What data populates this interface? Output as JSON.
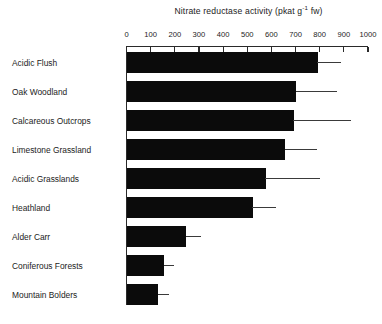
{
  "chart_data": {
    "type": "bar",
    "orientation": "horizontal",
    "title": "Nitrate reductase activity (pkat g-1 fw)",
    "title_main": "Nitrate reductase activity (pkat g",
    "title_sup": "-1",
    "title_tail": " fw)",
    "xlabel": "",
    "ylabel": "",
    "xlim": [
      0,
      1000
    ],
    "xticks": [
      0,
      100,
      200,
      300,
      400,
      500,
      600,
      700,
      800,
      900,
      1000
    ],
    "xtick_labels": [
      "0",
      "100",
      "200",
      "300",
      "400",
      "500",
      "600",
      "700",
      "800",
      "900",
      "1000"
    ],
    "grid": false,
    "legend": false,
    "categories": [
      "Acidic Flush",
      "Oak Woodland",
      "Calcareous Outcrops",
      "Limestone Grassland",
      "Acidic Grasslands",
      "Heathland",
      "Alder Carr",
      "Coniferous Forests",
      "Mountain Bolders"
    ],
    "values": [
      790,
      700,
      690,
      655,
      575,
      520,
      245,
      155,
      130
    ],
    "error_upper": [
      890,
      870,
      930,
      790,
      800,
      620,
      310,
      195,
      175
    ],
    "bar_color": "#0b0b0b",
    "error_color": "#3a3a3a"
  }
}
